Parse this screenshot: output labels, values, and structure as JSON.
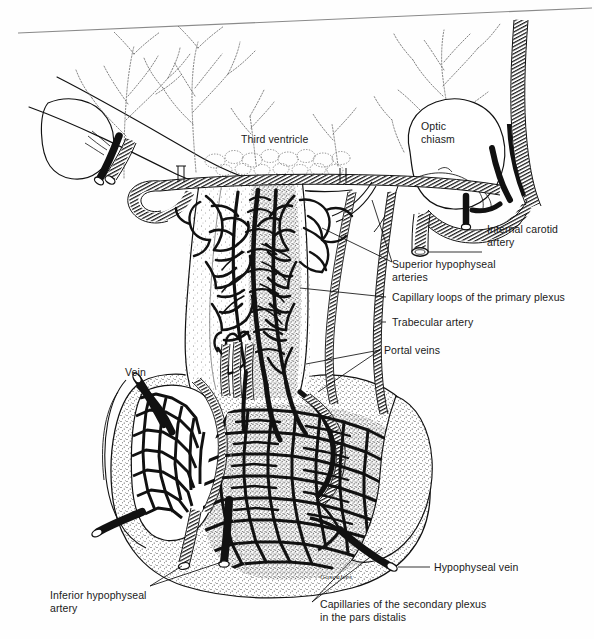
{
  "figure": {
    "signature": "Gonçalves",
    "ink_color": "#111111",
    "stipple_color": "#555555",
    "paper_color": "#fefefe"
  },
  "labels": {
    "third_ventricle": "Third ventricle",
    "optic_chiasm": "Optic\nchiasm",
    "internal_carotid_artery": "Internal carotid\nartery",
    "superior_hypophyseal_arteries": "Superior hypophyseal\narteries",
    "capillary_loops": "Capillary loops of the primary plexus",
    "trabecular_artery": "Trabecular artery",
    "portal_veins": "Portal veins",
    "vein": "Vein",
    "inferior_hypophyseal_artery": "Inferior hypophyseal\nartery",
    "hypophyseal_vein": "Hypophyseal vein",
    "capillaries_secondary_plexus": "Capillaries of the secondary plexus\nin the pars distalis"
  },
  "structures": [
    {
      "name": "third-ventricle",
      "label": "Third ventricle"
    },
    {
      "name": "optic-chiasm",
      "label": "Optic chiasm"
    },
    {
      "name": "internal-carotid-artery",
      "label": "Internal carotid artery"
    },
    {
      "name": "superior-hypophyseal-arteries",
      "label": "Superior hypophyseal arteries"
    },
    {
      "name": "primary-plexus-capillary-loops",
      "label": "Capillary loops of the primary plexus"
    },
    {
      "name": "trabecular-artery",
      "label": "Trabecular artery"
    },
    {
      "name": "portal-veins",
      "label": "Portal veins"
    },
    {
      "name": "vein",
      "label": "Vein"
    },
    {
      "name": "inferior-hypophyseal-artery",
      "label": "Inferior hypophyseal artery"
    },
    {
      "name": "hypophyseal-vein",
      "label": "Hypophyseal vein"
    },
    {
      "name": "secondary-plexus-capillaries",
      "label": "Capillaries of the secondary plexus in the pars distalis"
    }
  ]
}
